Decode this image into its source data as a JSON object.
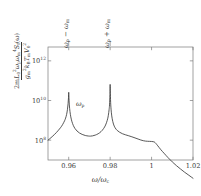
{
  "figure": {
    "kind": "log-linear spectral density plot",
    "frame": {
      "left": 48,
      "right": 193,
      "top": 47,
      "bottom": 160
    }
  },
  "axes": {
    "x": {
      "label_parts": {
        "omega": "ω",
        "slash": "/",
        "omega_c": "ω",
        "c_sub": "c"
      },
      "tick_labels": [
        "0.96",
        "0.98",
        "1",
        "1.02"
      ],
      "tick_values": [
        0.96,
        0.98,
        1.0,
        1.02
      ],
      "min": 0.95,
      "max": 1.02
    },
    "y": {
      "scale": "log",
      "tick_labels": [
        "10",
        "10",
        "10"
      ],
      "tick_exponents": [
        "8",
        "10",
        "12"
      ],
      "tick_values": [
        100000000.0,
        10000000000.0,
        1000000000000.0
      ],
      "min": 10000000.0,
      "max": 5000000000000.0,
      "label": {
        "numerator": {
          "lead": "2m",
          "L": "L",
          "L_sub": "0",
          "L_sup": "2",
          "omega_p": "ω",
          "p_sub": "p",
          "omega_m": "ω",
          "m_sub": "m",
          "m_sup": "4",
          "S": "S",
          "S_sub": "f",
          "arg": "(ω)"
        },
        "denominator": {
          "g": "g",
          "g_sub": "m",
          "g_sup": "2",
          "k": "k",
          "k_sub": "B",
          "T": "T",
          "T_sub": "m",
          "V": "V",
          "V_sub": "0",
          "V_sup": "2"
        }
      }
    }
  },
  "annotations": {
    "lower_sideband": {
      "text": "ω",
      "sub1": "p",
      "op": " − ",
      "text2": "ω",
      "sub2": "m",
      "x": 0.96
    },
    "upper_sideband": {
      "text": "ω",
      "sub1": "p",
      "op": " + ",
      "text2": "ω",
      "sub2": "m",
      "x": 0.98
    },
    "pump": {
      "text": "ω",
      "sub1": "p",
      "x": 0.9705
    }
  },
  "chart_data": {
    "type": "line",
    "title": "",
    "xlabel": "ω/ω_c",
    "ylabel": "2 m L_0^2 ω_p ω_m^4 S_f(ω) / (g_m^2 k_B T_m V_0^2)",
    "xlim": [
      0.95,
      1.02
    ],
    "ylim": [
      10000000.0,
      5000000000000.0
    ],
    "yscale": "log",
    "grid": false,
    "legend": null,
    "series": [
      {
        "name": "S_f spectrum",
        "color": "#3a3a3a",
        "x": [
          0.95,
          0.952,
          0.954,
          0.956,
          0.957,
          0.958,
          0.9585,
          0.959,
          0.9594,
          0.9597,
          0.9599,
          0.96,
          0.9601,
          0.9603,
          0.9606,
          0.961,
          0.9615,
          0.9622,
          0.963,
          0.964,
          0.9652,
          0.9665,
          0.968,
          0.9695,
          0.9705,
          0.9715,
          0.9728,
          0.9742,
          0.9756,
          0.9768,
          0.9778,
          0.9786,
          0.9791,
          0.9795,
          0.9797,
          0.9799,
          0.98,
          0.9801,
          0.9803,
          0.9806,
          0.981,
          0.9816,
          0.9824,
          0.9834,
          0.9846,
          0.986,
          0.9875,
          0.989,
          0.9905,
          0.992,
          0.9935,
          0.9948,
          0.996,
          0.997,
          0.998,
          0.999,
          1.0,
          1.0008,
          1.0014,
          1.002,
          1.003,
          1.0045,
          1.006,
          1.008,
          1.01,
          1.012,
          1.014,
          1.016,
          1.018,
          1.02
        ],
        "y": [
          100000000.0,
          150000000.0,
          240000000.0,
          420000000.0,
          600000000.0,
          950000000.0,
          1300000000.0,
          2000000000.0,
          3600000000.0,
          7000000000.0,
          14000000000.0,
          26000000000.0,
          15000000000.0,
          6000000000.0,
          2800000000.0,
          1500000000.0,
          900000000.0,
          560000000.0,
          390000000.0,
          290000000.0,
          230000000.0,
          195000000.0,
          172000000.0,
          162000000.0,
          160000000.0,
          165000000.0,
          180000000.0,
          210000000.0,
          270000000.0,
          380000000.0,
          580000000.0,
          1000000000.0,
          1700000000.0,
          3500000000.0,
          6000000000.0,
          20000000000.0,
          65000000000.0,
          22000000000.0,
          6000000000.0,
          2400000000.0,
          1200000000.0,
          650000000.0,
          420000000.0,
          310000000.0,
          250000000.0,
          210000000.0,
          185000000.0,
          166000000.0,
          148000000.0,
          130000000.0,
          114000000.0,
          102000000.0,
          94000000.0,
          90000000.0,
          88000000.0,
          87000000.0,
          86000000.0,
          84000000.0,
          80000000.0,
          70000000.0,
          52000000.0,
          33000000.0,
          22000000.0,
          13000000.0,
          8000000.0,
          5200000.0,
          3500000.0,
          2400000.0,
          1700000.0,
          1200000.0
        ]
      }
    ]
  }
}
